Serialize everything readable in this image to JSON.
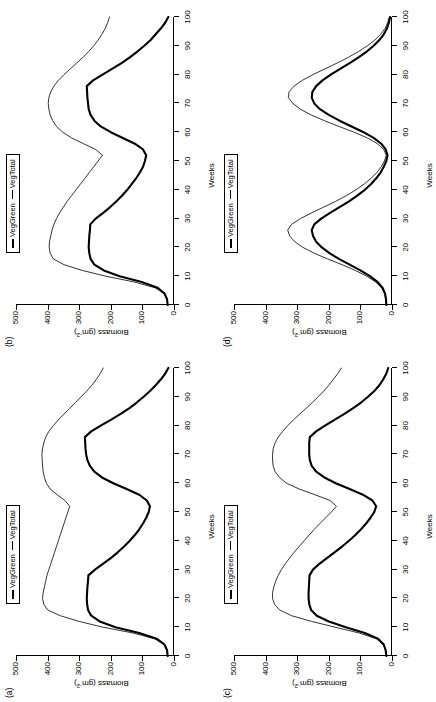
{
  "figure": {
    "orientation": "rotated-90-ccw",
    "background": "#ffffff",
    "ink": "#000000"
  },
  "legend": {
    "series_green_label": "VegGreen",
    "series_total_label": "VegTotal",
    "position": "top-center"
  },
  "axes": {
    "xlabel": "Weeks",
    "ylabel_main": "Biomass (gm",
    "ylabel_sup": "-2",
    "ylabel_close": ")",
    "xticks": [
      "0",
      "10",
      "20",
      "30",
      "40",
      "50",
      "60",
      "70",
      "80",
      "90",
      "100"
    ],
    "yticks": [
      "0",
      "100",
      "200",
      "300",
      "400",
      "500"
    ],
    "xlim": [
      0,
      100
    ],
    "ylim": [
      0,
      500
    ]
  },
  "panels": [
    {
      "tag": "(a)",
      "key": "a"
    },
    {
      "tag": "(b)",
      "key": "b"
    },
    {
      "tag": "(c)",
      "key": "c"
    },
    {
      "tag": "(d)",
      "key": "d"
    }
  ],
  "chart_data": [
    {
      "type": "line",
      "panel": "(a)",
      "title": "",
      "xlabel": "Weeks",
      "ylabel": "Biomass (gm-2)",
      "xlim": [
        0,
        100
      ],
      "ylim": [
        0,
        500
      ],
      "grid": false,
      "legend": [
        "VegGreen",
        "VegTotal"
      ],
      "x": [
        0,
        2,
        4,
        6,
        8,
        10,
        12,
        14,
        16,
        18,
        20,
        22,
        24,
        26,
        28,
        30,
        32,
        34,
        36,
        38,
        40,
        42,
        44,
        46,
        48,
        50,
        52,
        54,
        56,
        58,
        60,
        62,
        64,
        66,
        68,
        70,
        72,
        74,
        76,
        78,
        80,
        82,
        84,
        86,
        88,
        90,
        92,
        94,
        96,
        98,
        100
      ],
      "series": [
        {
          "name": "VegGreen",
          "width": "thick",
          "values": [
            20,
            22,
            30,
            55,
            110,
            185,
            235,
            262,
            272,
            275,
            276,
            275,
            274,
            272,
            271,
            250,
            225,
            200,
            178,
            158,
            140,
            124,
            110,
            98,
            88,
            80,
            76,
            86,
            110,
            150,
            192,
            228,
            252,
            266,
            274,
            278,
            280,
            281,
            282,
            262,
            232,
            200,
            170,
            142,
            118,
            96,
            76,
            58,
            42,
            28,
            18
          ]
        },
        {
          "name": "VegTotal",
          "width": "thin",
          "values": [
            20,
            22,
            32,
            62,
            130,
            225,
            300,
            360,
            400,
            412,
            416,
            414,
            410,
            406,
            402,
            396,
            390,
            384,
            378,
            372,
            366,
            360,
            354,
            348,
            342,
            336,
            330,
            345,
            370,
            392,
            404,
            410,
            414,
            416,
            417,
            418,
            416,
            412,
            406,
            396,
            382,
            366,
            348,
            330,
            312,
            294,
            276,
            260,
            246,
            234,
            224
          ]
        }
      ]
    },
    {
      "type": "line",
      "panel": "(b)",
      "title": "",
      "xlabel": "Weeks",
      "ylabel": "Biomass (gm-2)",
      "xlim": [
        0,
        100
      ],
      "ylim": [
        0,
        500
      ],
      "grid": false,
      "legend": [
        "VegGreen",
        "VegTotal"
      ],
      "x": [
        0,
        2,
        4,
        6,
        8,
        10,
        12,
        14,
        16,
        18,
        20,
        22,
        24,
        26,
        28,
        30,
        32,
        34,
        36,
        38,
        40,
        42,
        44,
        46,
        48,
        50,
        52,
        54,
        56,
        58,
        60,
        62,
        64,
        66,
        68,
        70,
        72,
        74,
        76,
        78,
        80,
        82,
        84,
        86,
        88,
        90,
        92,
        94,
        96,
        98,
        100
      ],
      "series": [
        {
          "name": "VegGreen",
          "width": "thick",
          "values": [
            20,
            22,
            30,
            52,
            102,
            172,
            222,
            252,
            264,
            268,
            270,
            269,
            268,
            266,
            265,
            248,
            224,
            202,
            182,
            164,
            148,
            134,
            120,
            108,
            98,
            92,
            88,
            98,
            124,
            162,
            200,
            232,
            252,
            264,
            270,
            272,
            274,
            275,
            276,
            256,
            226,
            196,
            166,
            140,
            116,
            94,
            74,
            58,
            42,
            28,
            18
          ]
        },
        {
          "name": "VegTotal",
          "width": "thin",
          "values": [
            20,
            22,
            32,
            60,
            126,
            216,
            290,
            348,
            382,
            392,
            395,
            394,
            390,
            386,
            380,
            372,
            362,
            350,
            338,
            324,
            310,
            296,
            282,
            268,
            254,
            240,
            226,
            248,
            286,
            324,
            352,
            372,
            384,
            392,
            396,
            398,
            396,
            390,
            380,
            366,
            348,
            328,
            308,
            288,
            270,
            254,
            240,
            228,
            218,
            210,
            204
          ]
        }
      ]
    },
    {
      "type": "line",
      "panel": "(c)",
      "title": "",
      "xlabel": "Weeks",
      "ylabel": "Biomass (gm-2)",
      "xlim": [
        0,
        100
      ],
      "ylim": [
        0,
        500
      ],
      "grid": false,
      "legend": [
        "VegGreen",
        "VegTotal"
      ],
      "x": [
        0,
        2,
        4,
        6,
        8,
        10,
        12,
        14,
        16,
        18,
        20,
        22,
        24,
        26,
        28,
        30,
        32,
        34,
        36,
        38,
        40,
        42,
        44,
        46,
        48,
        50,
        52,
        54,
        56,
        58,
        60,
        62,
        64,
        66,
        68,
        70,
        72,
        74,
        76,
        78,
        80,
        82,
        84,
        86,
        88,
        90,
        92,
        94,
        96,
        98,
        100
      ],
      "series": [
        {
          "name": "VegGreen",
          "width": "thick",
          "values": [
            18,
            20,
            26,
            44,
            86,
            146,
            200,
            238,
            256,
            262,
            264,
            264,
            263,
            262,
            261,
            250,
            230,
            206,
            182,
            158,
            136,
            116,
            98,
            82,
            68,
            56,
            50,
            62,
            92,
            134,
            178,
            214,
            240,
            254,
            260,
            262,
            262,
            262,
            260,
            240,
            212,
            182,
            152,
            124,
            98,
            76,
            56,
            40,
            28,
            18,
            12
          ]
        },
        {
          "name": "VegTotal",
          "width": "thin",
          "values": [
            18,
            20,
            28,
            50,
            104,
            180,
            254,
            318,
            356,
            372,
            378,
            378,
            374,
            368,
            360,
            350,
            338,
            324,
            310,
            294,
            278,
            262,
            246,
            228,
            210,
            192,
            176,
            196,
            244,
            294,
            334,
            356,
            370,
            376,
            378,
            378,
            376,
            370,
            360,
            346,
            330,
            312,
            292,
            272,
            252,
            234,
            216,
            200,
            186,
            172,
            160
          ]
        }
      ]
    },
    {
      "type": "line",
      "panel": "(d)",
      "title": "",
      "xlabel": "Weeks",
      "ylabel": "Biomass (gm-2)",
      "xlim": [
        0,
        100
      ],
      "ylim": [
        0,
        500
      ],
      "grid": false,
      "legend": [
        "VegGreen",
        "VegTotal"
      ],
      "x": [
        0,
        2,
        4,
        6,
        8,
        10,
        12,
        14,
        16,
        18,
        20,
        22,
        24,
        26,
        28,
        30,
        32,
        34,
        36,
        38,
        40,
        42,
        44,
        46,
        48,
        50,
        52,
        54,
        56,
        58,
        60,
        62,
        64,
        66,
        68,
        70,
        72,
        74,
        76,
        78,
        80,
        82,
        84,
        86,
        88,
        90,
        92,
        94,
        96,
        98,
        100
      ],
      "series": [
        {
          "name": "VegGreen",
          "width": "thick",
          "values": [
            18,
            19,
            22,
            30,
            46,
            70,
            100,
            134,
            168,
            198,
            222,
            240,
            250,
            254,
            246,
            224,
            196,
            166,
            136,
            110,
            86,
            66,
            50,
            36,
            26,
            18,
            14,
            20,
            34,
            58,
            90,
            128,
            166,
            200,
            228,
            246,
            254,
            252,
            240,
            220,
            194,
            164,
            134,
            106,
            80,
            58,
            40,
            26,
            16,
            10,
            6
          ]
        },
        {
          "name": "VegTotal",
          "width": "thin",
          "values": [
            18,
            19,
            23,
            33,
            52,
            80,
            116,
            158,
            204,
            246,
            282,
            308,
            324,
            330,
            318,
            290,
            254,
            216,
            178,
            144,
            114,
            88,
            66,
            48,
            34,
            24,
            18,
            26,
            46,
            78,
            120,
            168,
            214,
            256,
            290,
            314,
            328,
            326,
            310,
            284,
            250,
            212,
            174,
            138,
            106,
            78,
            54,
            36,
            22,
            14,
            8
          ]
        }
      ]
    }
  ]
}
